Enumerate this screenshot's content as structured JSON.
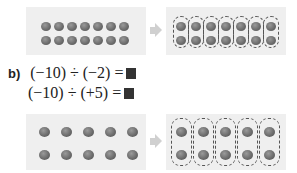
{
  "part_a_diagram": {
    "left_panel": {
      "rows": 2,
      "cols": 7,
      "counters": 14
    },
    "right_panel": {
      "groups": 7,
      "counters_per_group": 2,
      "grouping": "dashed ovals around each column pair"
    }
  },
  "part_b": {
    "label": "b)",
    "equations": [
      {
        "text": "(−10) ÷ (−2) =",
        "answer_box": "■"
      },
      {
        "text": "(−10) ÷ (+5) =",
        "answer_box": "■"
      }
    ]
  },
  "part_b_diagram": {
    "left_panel": {
      "rows": 2,
      "cols": 5,
      "counters": 10
    },
    "right_panel": {
      "groups": 5,
      "counters_per_group": 2,
      "grouping": "dashed ovals around each column pair"
    }
  },
  "colors": {
    "panel_bg": "#efefef",
    "counter": "#6d6d6d",
    "arrow": "#d0d0d0",
    "answer_box": "#333333"
  }
}
